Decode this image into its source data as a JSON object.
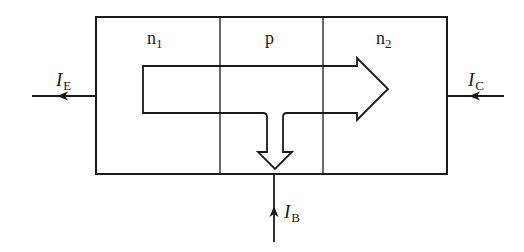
{
  "diagram": {
    "type": "npn-transistor-current-flow",
    "regions": [
      {
        "id": "n1",
        "label": "n",
        "subscript": "1"
      },
      {
        "id": "p",
        "label": "p",
        "subscript": ""
      },
      {
        "id": "n2",
        "label": "n",
        "subscript": "2"
      }
    ],
    "currents": {
      "emitter": {
        "symbol": "I",
        "subscript": "E",
        "direction": "out-left"
      },
      "collector": {
        "symbol": "I",
        "subscript": "C",
        "direction": "in-from-right"
      },
      "base": {
        "symbol": "I",
        "subscript": "B",
        "direction": "in-from-bottom"
      }
    },
    "flow_arrow": {
      "main": "left-to-right through n1, p, n2",
      "branch": "down into base region"
    },
    "colors": {
      "stroke": "#1a1a1a",
      "background": "#ffffff"
    }
  }
}
